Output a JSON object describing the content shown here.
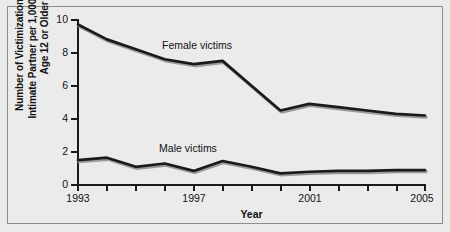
{
  "chart_data": {
    "type": "line",
    "title": "",
    "xlabel": "Year",
    "ylabel": "Number of Victimizations by an Intimate Partner per 1,000 Persons Age 12 or Older",
    "ylabel_lines": [
      "Number of Victimizations by an",
      "Intimate Partner per 1,000 Persons",
      "Age 12 or Older"
    ],
    "x": [
      1993,
      1994,
      1995,
      1996,
      1997,
      1998,
      1999,
      2000,
      2001,
      2002,
      2003,
      2004,
      2005
    ],
    "xlim": [
      1993,
      2005
    ],
    "ylim": [
      0,
      10
    ],
    "yticks": [
      0,
      2,
      4,
      6,
      8,
      10
    ],
    "ytick_labels": [
      "0",
      "2",
      "4",
      "6",
      "8",
      "10"
    ],
    "xticks": [
      1993,
      1994,
      1995,
      1996,
      1997,
      1998,
      1999,
      2000,
      2001,
      2002,
      2003,
      2004,
      2005
    ],
    "xtick_labels": [
      "1993",
      "",
      "",
      "",
      "1997",
      "",
      "",
      "",
      "2001",
      "",
      "",
      "",
      "2005"
    ],
    "grid": false,
    "legend": "inline-annotations",
    "series": [
      {
        "name": "Female victims",
        "color": "#1a1a1a",
        "values": [
          9.7,
          8.8,
          8.2,
          7.6,
          7.3,
          7.5,
          6.0,
          4.5,
          4.9,
          4.7,
          4.5,
          4.3,
          4.2
        ]
      },
      {
        "name": "Male victims",
        "color": "#1a1a1a",
        "values": [
          1.5,
          1.65,
          1.1,
          1.3,
          0.85,
          1.45,
          1.1,
          0.7,
          0.8,
          0.85,
          0.85,
          0.9,
          0.9
        ]
      }
    ],
    "annotations": [
      {
        "text": "Female victims",
        "x": 1997.2,
        "y": 8.6
      },
      {
        "text": "Male victims",
        "x": 1996.9,
        "y": 2.4
      }
    ]
  },
  "axis": {
    "x_title": "Year",
    "y_title_line1": "Number of Victimizations by an",
    "y_title_line2": "Intimate Partner per 1,000 Persons",
    "y_title_line3": "Age 12 or Older"
  },
  "labels": {
    "female": "Female victims",
    "male": "Male victims"
  },
  "ticks": {
    "y": [
      "10",
      "8",
      "6",
      "4",
      "2",
      "0"
    ],
    "x": [
      "1993",
      "1997",
      "2001",
      "2005"
    ]
  },
  "colors": {
    "background": "#ebebeb",
    "border": "#8d8d8d",
    "line": "#1a1a1a",
    "text": "#111111"
  }
}
